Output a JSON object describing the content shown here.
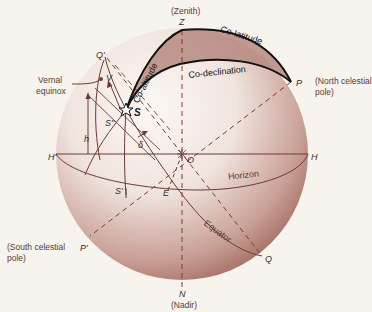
{
  "diagram": {
    "colors": {
      "background": "#f7f4ee",
      "sphere_light": "#f5efe8",
      "sphere_dark": "#a67468",
      "triangle_fill": "#b78c82",
      "line_color": "#7a3b33",
      "bold_line": "#111111",
      "label_color": "#5a3a34"
    },
    "points": {
      "zenith": {
        "letter": "Z",
        "caption": "(Zenith)"
      },
      "nadir": {
        "letter": "N",
        "caption": "(Nadir)"
      },
      "north_pole": {
        "letter": "P",
        "caption_line1": "(North celestial",
        "caption_line2": "pole)"
      },
      "south_pole": {
        "letter": "P'",
        "caption_line1": "(South celestial",
        "caption_line2": "pole)"
      },
      "center": {
        "letter": "O"
      },
      "horizon_east": {
        "letter": "H"
      },
      "horizon_west": {
        "letter": "H'"
      },
      "equator_top": {
        "letter": "Q'"
      },
      "equator_bottom": {
        "letter": "Q"
      },
      "east_point": {
        "letter": "E"
      },
      "star": {
        "letter": "S"
      },
      "star_horizon_foot": {
        "letter": "S'"
      },
      "star_equator_foot": {
        "letter": "S''"
      },
      "vernal_equinox": {
        "letter": "V",
        "caption_line1": "Vernal",
        "caption_line2": "equinox"
      }
    },
    "arcs": {
      "co_altitude": "Co-altitude",
      "co_latitude": "Co-latitude",
      "co_declination": "Co-declination",
      "horizon": "Horizon",
      "equator": "Equator"
    },
    "angles": {
      "altitude": "h",
      "declination": "δ"
    }
  }
}
